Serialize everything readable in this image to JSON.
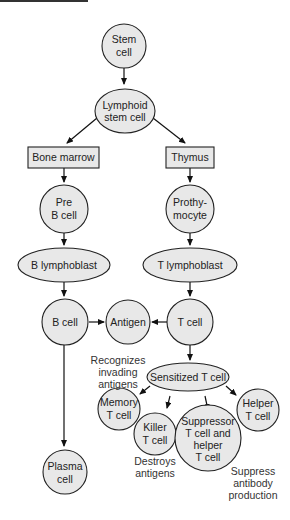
{
  "diagram": {
    "type": "flowchart",
    "topic": "Lymphocyte development",
    "nodes": {
      "stem_cell": [
        "Stem",
        "cell"
      ],
      "lymphoid_stem_cell": [
        "Lymphoid",
        "stem cell"
      ],
      "bone_marrow": "Bone marrow",
      "thymus": "Thymus",
      "pre_b_cell": [
        "Pre",
        "B cell"
      ],
      "prothymocyte": [
        "Prothy-",
        "mocyte"
      ],
      "b_lymphoblast": "B lymphoblast",
      "t_lymphoblast": "T lymphoblast",
      "b_cell": "B cell",
      "antigen": "Antigen",
      "t_cell": "T cell",
      "sensitized_t_cell": "Sensitized T cell",
      "memory_t_cell": [
        "Memory",
        "T cell"
      ],
      "killer_t_cell": [
        "Killer",
        "T cell"
      ],
      "suppressor_helper_t_cell": [
        "Suppressor",
        "T cell and",
        "helper",
        "T cell"
      ],
      "helper_t_cell": [
        "Helper",
        "T cell"
      ],
      "plasma_cell": [
        "Plasma",
        "cell"
      ]
    },
    "annotations": {
      "memory": [
        "Recognizes",
        "invading",
        "antigens"
      ],
      "killer": [
        "Destroys",
        "antigens"
      ],
      "suppressor": [
        "Suppress",
        "antibody",
        "production"
      ]
    },
    "edges": [
      [
        "stem_cell",
        "lymphoid_stem_cell"
      ],
      [
        "lymphoid_stem_cell",
        "bone_marrow"
      ],
      [
        "lymphoid_stem_cell",
        "thymus"
      ],
      [
        "bone_marrow",
        "pre_b_cell"
      ],
      [
        "thymus",
        "prothymocyte"
      ],
      [
        "pre_b_cell",
        "b_lymphoblast"
      ],
      [
        "prothymocyte",
        "t_lymphoblast"
      ],
      [
        "b_lymphoblast",
        "b_cell"
      ],
      [
        "t_lymphoblast",
        "t_cell"
      ],
      [
        "b_cell",
        "antigen"
      ],
      [
        "t_cell",
        "antigen"
      ],
      [
        "t_cell",
        "sensitized_t_cell"
      ],
      [
        "sensitized_t_cell",
        "memory_t_cell"
      ],
      [
        "sensitized_t_cell",
        "killer_t_cell"
      ],
      [
        "sensitized_t_cell",
        "suppressor_helper_t_cell"
      ],
      [
        "sensitized_t_cell",
        "helper_t_cell"
      ],
      [
        "b_cell",
        "plasma_cell"
      ]
    ]
  }
}
